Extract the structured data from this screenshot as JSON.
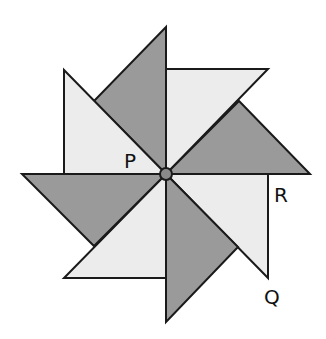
{
  "diagram": {
    "type": "pinwheel",
    "center": {
      "x": 166,
      "y": 174,
      "radius": 6,
      "fill": "#8a8a8a"
    },
    "colors": {
      "dark": "#9a9a9a",
      "light": "#ececec",
      "stroke": "#1a1a1a",
      "background": "#ffffff"
    },
    "blades": [
      {
        "name": "blade-north-dark",
        "shade": "dark",
        "points": "166,27 166,174 94,101"
      },
      {
        "name": "blade-northeast-light",
        "shade": "light",
        "points": "166,69 268,69 166,174"
      },
      {
        "name": "blade-east-dark",
        "shade": "dark",
        "points": "310,174 166,174 239,101"
      },
      {
        "name": "blade-southeast-light",
        "shade": "light",
        "points": "166,174 268,174 268,278"
      },
      {
        "name": "blade-south-dark",
        "shade": "dark",
        "points": "166,322 166,174 238,247"
      },
      {
        "name": "blade-southwest-light",
        "shade": "light",
        "points": "64,278 166,278 166,174"
      },
      {
        "name": "blade-west-dark",
        "shade": "dark",
        "points": "22,174 166,174 94,246"
      },
      {
        "name": "blade-northwest-light",
        "shade": "light",
        "points": "64,70 64,174 166,174"
      }
    ],
    "labels": [
      {
        "name": "label-p",
        "text": "P",
        "x": 124,
        "y": 168
      },
      {
        "name": "label-r",
        "text": "R",
        "x": 274,
        "y": 202
      },
      {
        "name": "label-q",
        "text": "Q",
        "x": 264,
        "y": 304
      }
    ]
  }
}
